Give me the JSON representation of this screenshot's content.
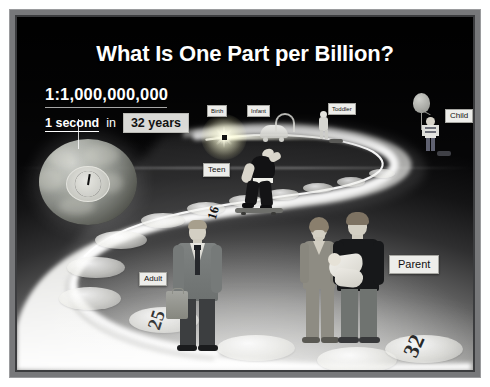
{
  "poster": {
    "title": "What Is One Part per Billion?",
    "ratio": {
      "value": "1:1,000,000,000",
      "numerator": "1 second",
      "connector": "in",
      "denominator": "32 years"
    }
  },
  "timeline": {
    "stages": [
      {
        "key": "birth",
        "label": "Birth",
        "icon": "starburst-icon"
      },
      {
        "key": "infant",
        "label": "Infant",
        "icon": "stroller-icon"
      },
      {
        "key": "toddler",
        "label": "Toddler",
        "icon": "toddler-figure-icon"
      },
      {
        "key": "child",
        "label": "Child",
        "icon": "child-with-balloon-icon"
      },
      {
        "key": "teen",
        "label": "Teen",
        "icon": "skateboarder-figure-icon"
      },
      {
        "key": "adult",
        "label": "Adult",
        "icon": "businessman-figure-icon"
      },
      {
        "key": "parent",
        "label": "Parent",
        "icon": "parents-with-baby-icon"
      }
    ],
    "age_markers": [
      "16",
      "25",
      "32"
    ]
  },
  "colors": {
    "frame": "#77787a",
    "frame_inner": "#3b3c3e",
    "backdrop_dark": "#060607",
    "backdrop_light": "#f4f4f2",
    "title_text": "#ffffff",
    "tag_bg": "#ededea",
    "tag_text": "#111111",
    "burst_glow": "#fffbe6"
  }
}
